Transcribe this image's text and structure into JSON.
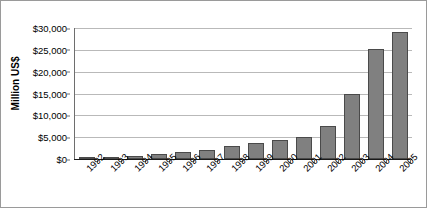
{
  "chart_data": {
    "type": "bar",
    "title": "",
    "xlabel": "",
    "ylabel": "Million US$",
    "categories": [
      "1992",
      "1993",
      "1994",
      "1995",
      "1996",
      "1997",
      "1998",
      "1999",
      "2000",
      "2001",
      "2002",
      "2003",
      "2004",
      "2005"
    ],
    "values": [
      200,
      450,
      800,
      1100,
      1500,
      2100,
      2900,
      3700,
      4300,
      5000,
      7500,
      15000,
      25200,
      29000
    ],
    "ylim": [
      0,
      30000
    ],
    "ytick_values": [
      0,
      5000,
      10000,
      15000,
      20000,
      25000,
      30000
    ],
    "ytick_labels": [
      "$0",
      "$5,000",
      "$10,000",
      "$15,000",
      "$20,000",
      "$25,000",
      "$30,000"
    ],
    "grid": true,
    "legend": "none",
    "series": [
      {
        "name": "Million US$",
        "values": [
          200,
          450,
          800,
          1100,
          1500,
          2100,
          2900,
          3700,
          4300,
          5000,
          7500,
          15000,
          25200,
          29000
        ]
      }
    ],
    "colors": {
      "bar_fill": "#808080",
      "bar_border": "#4a4a4a",
      "gridline": "#b9b9b9",
      "axis": "#1a1a1a",
      "text": "#000000",
      "background": "#ffffff",
      "frame_border": "#9a9a9a"
    }
  }
}
